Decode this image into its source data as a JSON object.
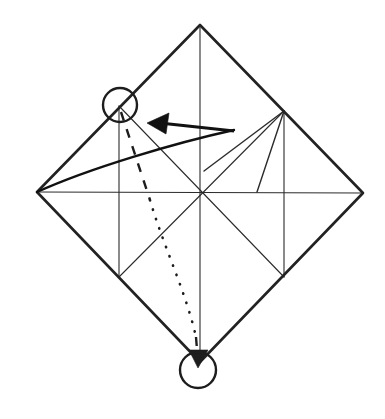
{
  "figure": {
    "kind": "line-drawing",
    "background_color": "#ffffff",
    "line_color": "#222222",
    "width": 385,
    "height": 419
  },
  "canvas": {
    "width": 385,
    "height": 419,
    "viewbox": "0 0 385 419"
  },
  "geometry": {
    "paper_outline": {
      "name": "square-rotated-45",
      "points": "200,25 363,193 200,362 37,192",
      "vertices": {
        "top": [
          200,
          25
        ],
        "right": [
          363,
          193
        ],
        "bottom": [
          200,
          362
        ],
        "left": [
          37,
          192
        ]
      }
    },
    "center": [
      201,
      193
    ],
    "creases": {
      "vertical_center": "200,25 200,362",
      "horizontal_center": "37,192 363,193",
      "inner_vertical_left": "119,106 119,277",
      "inner_vertical_right": "284,111 284,277",
      "diagonal_tl_br": "119,106 284,277",
      "diagonal_bl_tr": "119,277 284,111",
      "inner_square_top_left": "119,106 200,25",
      "inner_square_top_right": "200,25 284,111",
      "inner_square_bottom_left": "119,277 200,362",
      "inner_square_bottom_right": "200,362 284,277"
    },
    "fan_lines": {
      "apex": [
        284,
        111
      ],
      "rays": [
        "284,111 204,171",
        "284,111 257,192"
      ]
    }
  },
  "annotations": {
    "top_marker": {
      "label": "reference-point-top",
      "center": [
        120,
        105
      ],
      "radius": 17
    },
    "bottom_marker": {
      "label": "target-point-bottom",
      "center": [
        198,
        370
      ],
      "radius": 18
    },
    "fold_arrow": {
      "label": "fold-direction-arrow",
      "points_to": "left",
      "tip": [
        147,
        123
      ],
      "tail": [
        234,
        131
      ],
      "shaft": "234,131 160,123",
      "head": "147,123 169,113 166,134"
    },
    "sweep_curve": {
      "label": "fold-sweep-curve",
      "path": "M 37,192 C 90,168 175,143 234,130"
    },
    "motion_path": {
      "label": "point-travel-path",
      "dashed_upper": "M 121,112 L 150,200",
      "dotted_middle": "M 150,200 C 163,245 186,292 196,337",
      "dashed_lower": "M 196,337 L 198,362",
      "head": "198,368 189,350 208,350"
    }
  },
  "legend": {
    "solid_line": "crease / edge",
    "dashed_line": "hidden motion",
    "dotted_line": "path of travel",
    "circle": "reference point",
    "arrow": "fold direction"
  }
}
